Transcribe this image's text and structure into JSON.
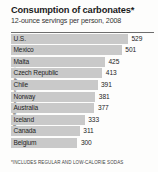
{
  "title": "Consumption of carbonates*",
  "subtitle": "12-ounce servings per person, 2008",
  "footnote": "*INCLUDES REGULAR AND LOW-CALORIE SODAS",
  "credit": "NGM Art/National Geographic Stock",
  "colors": {
    "bar": "#c9c9c9",
    "background": "#fdfdfc",
    "text": "#232323",
    "rule": "#6d6d6d"
  },
  "chart_data": {
    "type": "bar",
    "orientation": "horizontal",
    "title": "Consumption of carbonates*",
    "subtitle": "12-ounce servings per person, 2008",
    "xlabel": "",
    "ylabel": "",
    "grid": false,
    "legend": "none",
    "note": "*INCLUDES REGULAR AND LOW-CALORIE SODAS",
    "xlim": [
      0,
      529
    ],
    "categories": [
      "U.S.",
      "Mexico",
      "Malta",
      "Czech Republic",
      "Chile",
      "Norway",
      "Australia",
      "Iceland",
      "Canada",
      "Belgium"
    ],
    "values": [
      529,
      501,
      425,
      413,
      391,
      381,
      377,
      333,
      311,
      300
    ],
    "rows": [
      {
        "label": "U.S.",
        "value": 529,
        "value_text": "529"
      },
      {
        "label": "Mexico",
        "value": 501,
        "value_text": "501"
      },
      {
        "label": "Malta",
        "value": 425,
        "value_text": "425"
      },
      {
        "label": "Czech Republic",
        "value": 413,
        "value_text": "413"
      },
      {
        "label": "Chile",
        "value": 391,
        "value_text": "391"
      },
      {
        "label": "Norway",
        "value": 381,
        "value_text": "381"
      },
      {
        "label": "Australia",
        "value": 377,
        "value_text": "377"
      },
      {
        "label": "Iceland",
        "value": 333,
        "value_text": "333"
      },
      {
        "label": "Canada",
        "value": 311,
        "value_text": "311"
      },
      {
        "label": "Belgium",
        "value": 300,
        "value_text": "300"
      }
    ]
  }
}
